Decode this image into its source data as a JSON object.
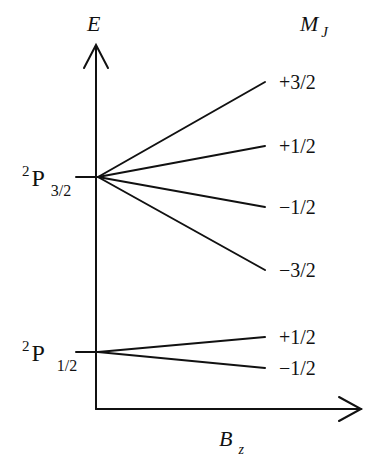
{
  "diagram": {
    "axes": {
      "y_label": "E",
      "x_label_main": "B",
      "x_label_sub": "z",
      "column_header_main": "M",
      "column_header_sub": "J"
    },
    "levels": [
      {
        "name_sup": "2",
        "name_main": "P",
        "name_sub": "3/2",
        "y": 177,
        "sublevels": [
          {
            "mj": "+3/2",
            "y_end": 82
          },
          {
            "mj": "+1/2",
            "y_end": 146
          },
          {
            "mj": "−1/2",
            "y_end": 207
          },
          {
            "mj": "−3/2",
            "y_end": 270
          }
        ]
      },
      {
        "name_sup": "2",
        "name_main": "P",
        "name_sub": "1/2",
        "y": 352,
        "sublevels": [
          {
            "mj": "+1/2",
            "y_end": 337
          },
          {
            "mj": "−1/2",
            "y_end": 368
          }
        ]
      }
    ],
    "colors": {
      "line": "#111111",
      "background": "#ffffff"
    }
  }
}
